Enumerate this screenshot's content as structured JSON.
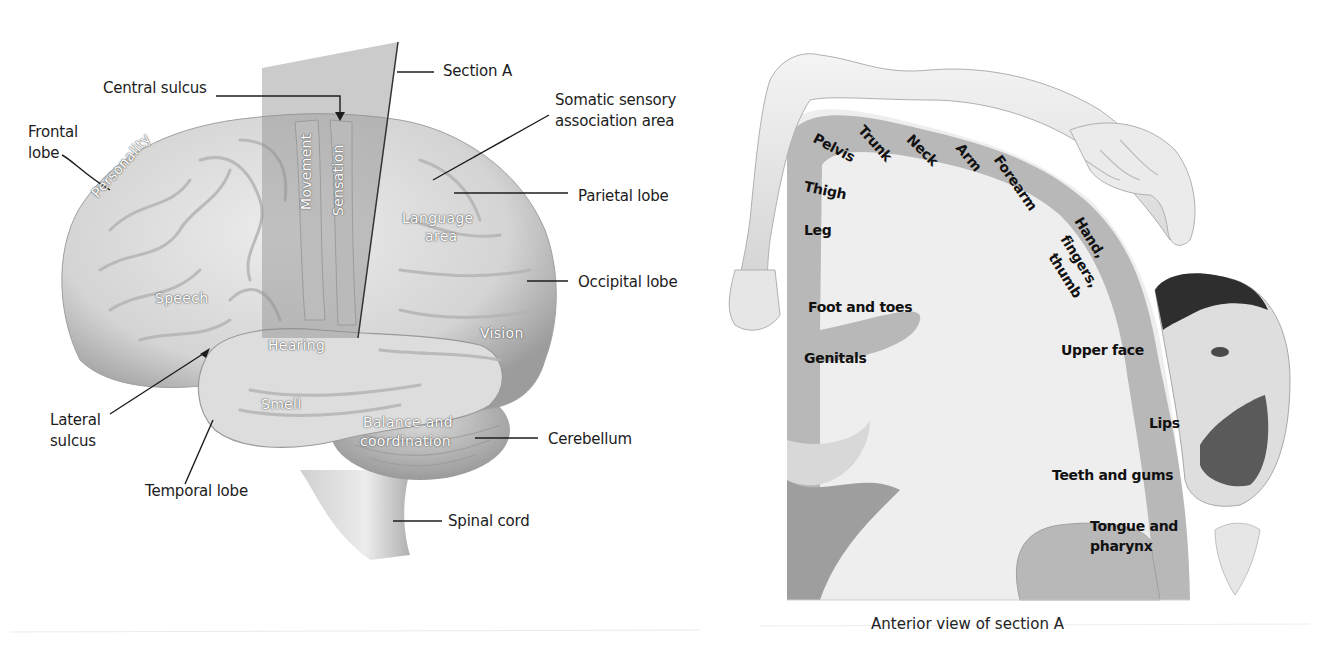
{
  "figure": {
    "left_panel": {
      "name": "Lateral view of brain",
      "callout_labels": {
        "central_sulcus": "Central sulcus",
        "section_a": "Section A",
        "somatic_sensory_association": "Somatic sensory association area",
        "somatic_line1": "Somatic sensory",
        "somatic_line2": "association area",
        "frontal_lobe_line1": "Frontal",
        "frontal_lobe_line2": "lobe",
        "parietal_lobe": "Parietal lobe",
        "occipital_lobe": "Occipital lobe",
        "lateral_sulcus_line1": "Lateral",
        "lateral_sulcus_line2": "sulcus",
        "cerebellum": "Cerebellum",
        "temporal_lobe": "Temporal lobe",
        "spinal_cord": "Spinal cord"
      },
      "region_labels": {
        "personality": "Personality",
        "movement": "Movement",
        "sensation": "Sensation",
        "language_line1": "Language",
        "language_line2": "area",
        "speech": "Speech",
        "hearing": "Hearing",
        "vision": "Vision",
        "smell": "Smell",
        "balance_line1": "Balance and",
        "balance_line2": "coordination"
      }
    },
    "right_panel": {
      "name": "Sensory homunculus",
      "body_part_labels": {
        "pelvis": "Pelvis",
        "trunk": "Trunk",
        "neck": "Neck",
        "arm": "Arm",
        "forearm": "Forearm",
        "hand_line1": "Hand,",
        "hand_line2": "fingers,",
        "hand_line3": "thumb",
        "thigh": "Thigh",
        "leg": "Leg",
        "foot": "Foot and toes",
        "genitals": "Genitals",
        "upper_face": "Upper face",
        "lips": "Lips",
        "teeth": "Teeth and gums",
        "tongue_line1": "Tongue and",
        "tongue_line2": "pharynx"
      },
      "caption": "Anterior view of section A"
    },
    "colors": {
      "background": "#ffffff",
      "brain_fill": "#d9d9d9",
      "brain_shadow": "#a8a8a8",
      "section_plane": "#9a9a9a",
      "cortex_band": "#b5b5b5",
      "white_matter": "#ececec",
      "label_text": "#1c1c1c"
    }
  }
}
